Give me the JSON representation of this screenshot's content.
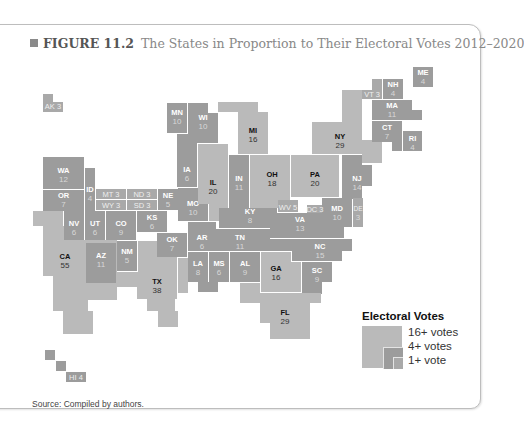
{
  "figure": {
    "number": "FIGURE 11.2",
    "title": "The States in Proportion to Their Electoral Votes 2012–2020",
    "source": "Source: Compiled by authors."
  },
  "legend": {
    "title": "Electoral Votes",
    "items": [
      {
        "label": "16+ votes",
        "color": "#bababa"
      },
      {
        "label": "4+ votes",
        "color": "#9c9c9c"
      },
      {
        "label": "1+ vote",
        "color": "#a9a9a9"
      }
    ]
  },
  "states": {
    "AK": {
      "abbr": "AK",
      "votes": "3",
      "inline": "AK 3"
    },
    "HI": {
      "abbr": "HI",
      "votes": "4",
      "inline": "HI 4"
    },
    "WA": {
      "abbr": "WA",
      "votes": "12"
    },
    "OR": {
      "abbr": "OR",
      "votes": "7"
    },
    "ID": {
      "abbr": "ID",
      "votes": "4"
    },
    "MT": {
      "abbr": "MT",
      "votes": "3",
      "inline": "MT 3"
    },
    "WY": {
      "abbr": "WY",
      "votes": "3",
      "inline": "WY 3"
    },
    "ND": {
      "abbr": "ND",
      "votes": "3",
      "inline": "ND 3"
    },
    "SD": {
      "abbr": "SD",
      "votes": "3",
      "inline": "SD 3"
    },
    "NE": {
      "abbr": "NE",
      "votes": "5"
    },
    "MN": {
      "abbr": "MN",
      "votes": "10"
    },
    "WI": {
      "abbr": "WI",
      "votes": "10"
    },
    "MI": {
      "abbr": "MI",
      "votes": "16"
    },
    "IA": {
      "abbr": "IA",
      "votes": "6"
    },
    "IL": {
      "abbr": "IL",
      "votes": "20"
    },
    "IN": {
      "abbr": "IN",
      "votes": "11"
    },
    "OH": {
      "abbr": "OH",
      "votes": "18"
    },
    "PA": {
      "abbr": "PA",
      "votes": "20"
    },
    "NY": {
      "abbr": "NY",
      "votes": "29"
    },
    "VT": {
      "abbr": "VT",
      "votes": "3",
      "inline": "VT 3"
    },
    "NH": {
      "abbr": "NH",
      "votes": "4"
    },
    "ME": {
      "abbr": "ME",
      "votes": "4"
    },
    "MA": {
      "abbr": "MA",
      "votes": "11"
    },
    "CT": {
      "abbr": "CT",
      "votes": "7"
    },
    "RI": {
      "abbr": "RI",
      "votes": "4"
    },
    "NJ": {
      "abbr": "NJ",
      "votes": "14"
    },
    "DE": {
      "abbr": "DE",
      "votes": "3"
    },
    "MD": {
      "abbr": "MD",
      "votes": "10"
    },
    "DC": {
      "abbr": "DC",
      "votes": "3",
      "inline": "DC 3"
    },
    "VA": {
      "abbr": "VA",
      "votes": "13"
    },
    "WV": {
      "abbr": "WV",
      "votes": "5",
      "inline": "WV 5"
    },
    "KY": {
      "abbr": "KY",
      "votes": "8"
    },
    "TN": {
      "abbr": "TN",
      "votes": "11"
    },
    "NC": {
      "abbr": "NC",
      "votes": "15"
    },
    "SC": {
      "abbr": "SC",
      "votes": "9"
    },
    "GA": {
      "abbr": "GA",
      "votes": "16"
    },
    "FL": {
      "abbr": "FL",
      "votes": "29"
    },
    "AL": {
      "abbr": "AL",
      "votes": "9"
    },
    "MS": {
      "abbr": "MS",
      "votes": "6"
    },
    "LA": {
      "abbr": "LA",
      "votes": "8"
    },
    "AR": {
      "abbr": "AR",
      "votes": "6"
    },
    "MO": {
      "abbr": "MO",
      "votes": "10"
    },
    "KS": {
      "abbr": "KS",
      "votes": "6"
    },
    "OK": {
      "abbr": "OK",
      "votes": "7"
    },
    "TX": {
      "abbr": "TX",
      "votes": "38"
    },
    "NM": {
      "abbr": "NM",
      "votes": "5"
    },
    "AZ": {
      "abbr": "AZ",
      "votes": "11"
    },
    "CO": {
      "abbr": "CO",
      "votes": "9"
    },
    "UT": {
      "abbr": "UT",
      "votes": "6"
    },
    "NV": {
      "abbr": "NV",
      "votes": "6"
    },
    "CA": {
      "abbr": "CA",
      "votes": "55"
    }
  }
}
